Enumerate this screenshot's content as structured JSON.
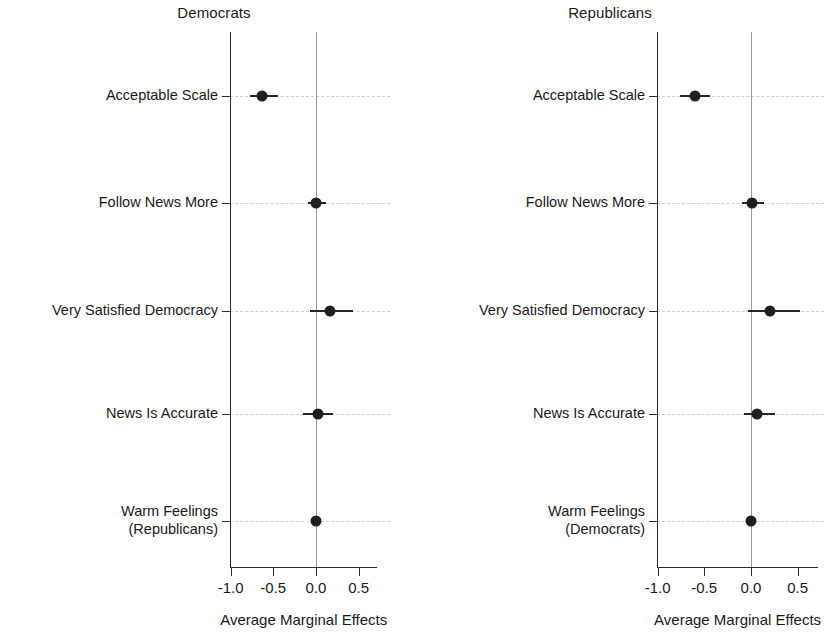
{
  "chart_data": {
    "type": "scatter",
    "subtype": "coefficient-plot-with-error-bars",
    "title": "",
    "xlabel": "Average Marginal Effects",
    "ylabel": "",
    "xlim": [
      -1.25,
      0.75
    ],
    "xticks": [
      -1.0,
      -0.5,
      0.0,
      0.5
    ],
    "xtick_labels": [
      "-1.0",
      "-0.5",
      "0.0",
      "0.5"
    ],
    "grid": "horizontal-dashed",
    "legend": "none",
    "reference_line": 0.0,
    "panels": [
      {
        "title": "Democrats",
        "categories": [
          "Acceptable Scale",
          "Follow News More",
          "Very Satisfied Democracy",
          "News Is Accurate",
          "Warm Feelings\n(Republicans)"
        ],
        "values": [
          -0.63,
          0.0,
          0.16,
          0.02,
          0.0
        ],
        "ci_low": [
          -0.77,
          -0.09,
          -0.07,
          -0.15,
          -0.02
        ],
        "ci_high": [
          -0.44,
          0.12,
          0.43,
          0.2,
          0.02
        ]
      },
      {
        "title": "Republicans",
        "categories": [
          "Acceptable Scale",
          "Follow News More",
          "Very Satisfied Democracy",
          "News Is Accurate",
          "Warm Feelings\n(Democrats)"
        ],
        "values": [
          -0.6,
          0.01,
          0.2,
          0.06,
          0.0
        ],
        "ci_low": [
          -0.76,
          -0.1,
          -0.03,
          -0.07,
          -0.02
        ],
        "ci_high": [
          -0.44,
          0.14,
          0.52,
          0.26,
          0.02
        ]
      }
    ]
  },
  "panels": {
    "left": {
      "title": "Democrats",
      "axis_title": "Average Marginal Effects",
      "xtick_labels": [
        "-1.0",
        "-0.5",
        "0.0",
        "0.5"
      ],
      "category_labels": [
        {
          "line1": "Acceptable Scale",
          "line2": ""
        },
        {
          "line1": "Follow News More",
          "line2": ""
        },
        {
          "line1": "Very Satisfied Democracy",
          "line2": ""
        },
        {
          "line1": "News Is Accurate",
          "line2": ""
        },
        {
          "line1": "Warm Feelings",
          "line2": "(Republicans)"
        }
      ]
    },
    "right": {
      "title": "Republicans",
      "axis_title": "Average Marginal Effects",
      "xtick_labels": [
        "-1.0",
        "-0.5",
        "0.0",
        "0.5"
      ],
      "category_labels": [
        {
          "line1": "Acceptable Scale",
          "line2": ""
        },
        {
          "line1": "Follow News More",
          "line2": ""
        },
        {
          "line1": "Very Satisfied Democracy",
          "line2": ""
        },
        {
          "line1": "News Is Accurate",
          "line2": ""
        },
        {
          "line1": "Warm Feelings",
          "line2": "(Democrats)"
        }
      ]
    }
  },
  "colors": {
    "point": "#1f1f1f",
    "error_bar": "#262626",
    "axis": "#2b2b2b",
    "gridline": "#cfcfcf",
    "zero_line": "#9a9a9a",
    "background": "#ffffff",
    "text": "#1a1a1a"
  }
}
